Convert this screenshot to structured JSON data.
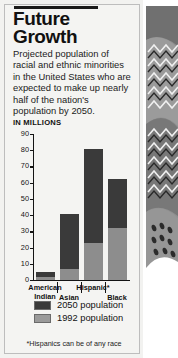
{
  "headline": {
    "line1": "Future",
    "line2": "Growth"
  },
  "blurb": "Projected population of racial and ethnic minorities in the United States who are expected to make up nearly half of the nation's population by 2050.",
  "units_label": "IN MILLIONS",
  "footnote": "*Hispanics can be of any race",
  "legend": [
    {
      "key": "future",
      "label": "2050 population",
      "color": "#3a3a3a"
    },
    {
      "key": "past",
      "label": "1992 population",
      "color": "#9a9a9a"
    }
  ],
  "colors": {
    "bar_2050": "#3a3a3a",
    "bar_1992": "#8d8d8d",
    "panel_background": "#f4f4f2",
    "axis": "#141414",
    "text": "#111111"
  },
  "chart_data": {
    "type": "bar",
    "stacked": true,
    "title": "Future Growth",
    "xlabel": "",
    "ylabel": "IN MILLIONS",
    "ylim": [
      0,
      90
    ],
    "yticks": [
      0,
      10,
      20,
      30,
      40,
      50,
      60,
      70,
      80,
      90
    ],
    "ytick_labels": [
      "0",
      "10",
      "20",
      "30",
      "40",
      "50",
      "60",
      "70",
      "80",
      "90"
    ],
    "grid": false,
    "legend_position": "below",
    "categories": [
      {
        "line1": "American",
        "line2": "Indian"
      },
      {
        "line1": "",
        "line2": "Asian"
      },
      {
        "line1": "Hispanic*",
        "line2": ""
      },
      {
        "line1": "",
        "line2": "Black"
      }
    ],
    "category_names": [
      "American Indian",
      "Asian",
      "Hispanic*",
      "Black"
    ],
    "series": [
      {
        "name": "1992 population",
        "values": [
          2,
          7,
          23,
          32
        ]
      },
      {
        "name": "2050 population",
        "values": [
          5,
          41,
          81,
          62
        ]
      }
    ],
    "annotations": [
      "*Hispanics can be of any race"
    ]
  },
  "art": {
    "name": "abstract-zigzag-illustration"
  }
}
